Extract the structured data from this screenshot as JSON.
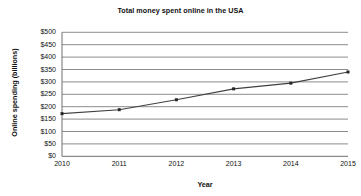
{
  "chart_data": {
    "type": "line",
    "title": "Total money spent online in the USA",
    "xlabel": "Year",
    "ylabel": "Online spending (billions)",
    "categories": [
      "2010",
      "2011",
      "2012",
      "2013",
      "2014",
      "2015"
    ],
    "x": [
      2010,
      2011,
      2012,
      2013,
      2014,
      2015
    ],
    "values": [
      172,
      188,
      228,
      272,
      295,
      340
    ],
    "series": [
      {
        "name": "Online spending",
        "values": [
          172,
          188,
          228,
          272,
          295,
          340
        ]
      }
    ],
    "ylim": [
      0,
      500
    ],
    "xlim": [
      2010,
      2015
    ],
    "yticks": [
      0,
      50,
      100,
      150,
      200,
      250,
      300,
      350,
      400,
      450,
      500
    ],
    "ytick_labels": [
      "$0",
      "$50",
      "$100",
      "$150",
      "$200",
      "$250",
      "$300",
      "$350",
      "$400",
      "$450",
      "$500"
    ],
    "xtick_labels": [
      "2010",
      "2011",
      "2012",
      "2013",
      "2014",
      "2015"
    ],
    "grid": "horizontal",
    "legend": "none",
    "line_color": "#404040",
    "marker_color": "#262626",
    "grid_color": "#8c8c8c",
    "axis_color": "#6e6e6e",
    "background_color": "#ffffff"
  }
}
